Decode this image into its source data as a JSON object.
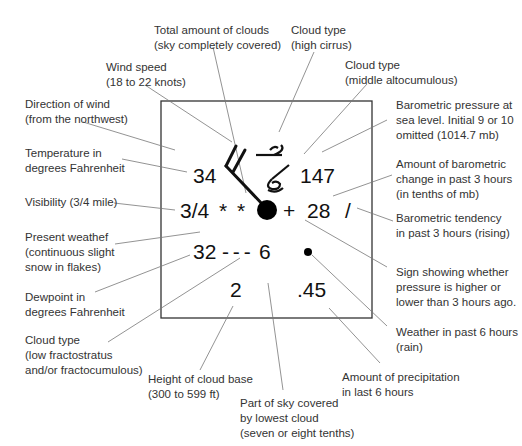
{
  "diagram": {
    "station": {
      "temperature": "34",
      "visibility": "3/4",
      "present_weather": "* *",
      "dewpoint": "32",
      "low_cloud_symbol": "- - -",
      "lowest_cloud_amount": "6",
      "cloud_base_height": "2",
      "pressure": "147",
      "pressure_change_sign": "+",
      "pressure_change": "28",
      "pressure_tendency": "/",
      "past_weather": "•",
      "precipitation": ".45"
    },
    "labels": {
      "total_clouds": "Total amount of clouds\n(sky completely covered)",
      "wind_speed": "Wind speed\n(18 to 22 knots)",
      "wind_direction": "Direction of wind\n(from the northwest)",
      "temperature": "Temperature in\ndegrees Fahrenheit",
      "visibility": "Visibility (3/4 mile)",
      "present_weather": "Present weathef\n(continuous slight\nsnow in flakes)",
      "dewpoint": "Dewpoint in\ndegrees Fahrenheit",
      "low_cloud_type": "Cloud type\n(low fractostratus\nand/or fractocumulous)",
      "cloud_base": "Height of cloud base\n(300 to 599 ft)",
      "lowest_cloud_cover": "Part of sky covered\nby lowest cloud\n(seven or eight tenths)",
      "precipitation": "Amount of precipitation\nin last 6 hours",
      "past_weather": "Weather in past 6 hours\n(rain)",
      "pressure_sign": "Sign showing whether\npressure is higher or\nlower than 3 hours ago.",
      "tendency": "Barometric tendency\nin past 3 hours (rising)",
      "pressure_change": "Amount of barometric\nchange in past 3 hours\n(in tenths of mb)",
      "pressure": "Barometric pressure at\nsea level. Initial 9 or 10\nomitted (1014.7 mb)",
      "middle_cloud": "Cloud type\n(middle altocumulous)",
      "high_cloud": "Cloud type\n(high cirrus)"
    }
  }
}
